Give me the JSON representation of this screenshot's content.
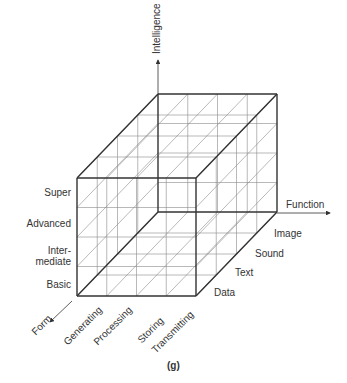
{
  "figure": {
    "caption": "(g)",
    "axes": {
      "vertical": {
        "name": "Intelligence",
        "levels": [
          "Basic",
          "Inter-\nmediate",
          "Advanced",
          "Super"
        ]
      },
      "horizontal": {
        "name": "Function",
        "levels": [
          "Data",
          "Text",
          "Sound",
          "Image"
        ]
      },
      "depth": {
        "name": "Form",
        "levels": [
          "Generating",
          "Processing",
          "Storing",
          "Transmitting"
        ]
      }
    },
    "colors": {
      "thin": "#8a8a8a",
      "thick": "#333333",
      "text": "#333333"
    }
  }
}
